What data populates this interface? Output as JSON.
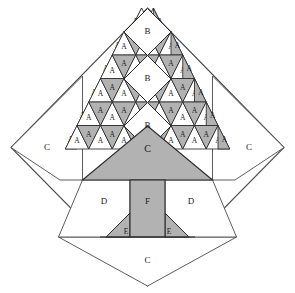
{
  "figure": {
    "name": "tree-quilt-block-diagram",
    "width": 295,
    "height": 293
  },
  "colors": {
    "background": "#ffffff",
    "fill_light": "#ffffff",
    "fill_shade": "#b2b2b2",
    "outline": "#2b2b2b",
    "outline_light": "#555555",
    "label_text": "#1a1a1a"
  },
  "geometry": {
    "center_x": 147.5,
    "center_y": 147.5,
    "diamond_top": {
      "x": 147.5,
      "y": 8
    },
    "diamond_right": {
      "x": 284,
      "y": 147.5
    },
    "diamond_bottom": {
      "x": 147.5,
      "y": 286
    },
    "diamond_left": {
      "x": 11,
      "y": 147.5
    },
    "cell": 23.5,
    "row_height": 23.5,
    "grid_rows": 7,
    "foliage_apex_y": 8,
    "foliage_base_y": 180,
    "trunk_top_y": 180,
    "trunk_bottom_y": 237,
    "baseline_y": 237
  },
  "legend": {
    "patch_codes": [
      "A",
      "B",
      "C",
      "D",
      "E",
      "F"
    ],
    "descriptions": {
      "A": "half-square triangle pair (foliage)",
      "B": "plain square on point (foliage highlight)",
      "C": "large corner / body triangle",
      "D": "background triangle beside trunk",
      "E": "small trunk-base triangle",
      "F": "trunk rectangle"
    }
  },
  "labels": {
    "A": "A",
    "B": "B",
    "C": "C",
    "D": "D",
    "E": "E",
    "F": "F"
  },
  "patches": {
    "B_squares": [
      {
        "label": "B",
        "x": 147.5,
        "y": 32
      },
      {
        "label": "B",
        "x": 147.5,
        "y": 79
      },
      {
        "label": "B",
        "x": 147.5,
        "y": 126
      }
    ],
    "C_pieces": [
      {
        "label": "C",
        "x": 47,
        "y": 148,
        "role": "left-corner"
      },
      {
        "label": "C",
        "x": 248,
        "y": 148,
        "role": "right-corner"
      },
      {
        "label": "C",
        "x": 147.5,
        "y": 263,
        "role": "bottom-corner"
      },
      {
        "label": "C",
        "x": 147.5,
        "y": 150,
        "role": "tree-body"
      }
    ],
    "D_pieces": [
      {
        "label": "D",
        "x": 104,
        "y": 202
      },
      {
        "label": "D",
        "x": 191,
        "y": 202
      }
    ],
    "E_pieces": [
      {
        "label": "E",
        "x": 127,
        "y": 232
      },
      {
        "label": "E",
        "x": 168,
        "y": 232
      }
    ],
    "F_pieces": [
      {
        "label": "F",
        "x": 147.5,
        "y": 202
      }
    ],
    "A_count": 66
  },
  "foliage_rows": [
    {
      "row": 1,
      "y_top": 8,
      "y_bottom": 31.5,
      "cells": [
        {
          "label": "A",
          "shade": "shade",
          "orient": "down-left"
        },
        {
          "label": "A",
          "shade": "light",
          "orient": "up"
        },
        {
          "label": "A",
          "shade": "light",
          "orient": "up"
        },
        {
          "label": "A",
          "shade": "shade",
          "orient": "down-right"
        }
      ]
    },
    {
      "row": 2,
      "y_top": 31.5,
      "y_bottom": 55,
      "cells": [
        {
          "label": "A",
          "shade": "shade",
          "orient": "down-left"
        },
        {
          "label": "A",
          "shade": "light",
          "orient": "up"
        },
        {
          "label": "A",
          "shade": "shade",
          "orient": "down"
        },
        {
          "label": "A",
          "shade": "light",
          "orient": "up"
        },
        {
          "label": "A",
          "shade": "shade",
          "orient": "down"
        },
        {
          "label": "A",
          "shade": "light",
          "orient": "up"
        },
        {
          "label": "A",
          "shade": "shade",
          "orient": "down-right"
        }
      ]
    },
    {
      "row": 3,
      "y_top": 55,
      "y_bottom": 78.5,
      "cells": [
        {
          "label": "A",
          "shade": "shade",
          "orient": "down-left"
        },
        {
          "label": "A",
          "shade": "light",
          "orient": "up"
        },
        {
          "label": "A",
          "shade": "shade",
          "orient": "down"
        },
        {
          "label": "A",
          "shade": "light",
          "orient": "up"
        },
        {
          "label": "A",
          "shade": "shade",
          "orient": "down"
        },
        {
          "label": "A",
          "shade": "light",
          "orient": "up"
        },
        {
          "label": "A",
          "shade": "shade",
          "orient": "down"
        },
        {
          "label": "A",
          "shade": "light",
          "orient": "up"
        },
        {
          "label": "A",
          "shade": "shade",
          "orient": "down-right"
        }
      ]
    },
    {
      "row": 4,
      "y_top": 78.5,
      "y_bottom": 102,
      "cells": [
        {
          "label": "A",
          "shade": "shade",
          "orient": "down-left"
        },
        {
          "label": "A",
          "shade": "light",
          "orient": "up"
        },
        {
          "label": "A",
          "shade": "shade",
          "orient": "down"
        },
        {
          "label": "A",
          "shade": "light",
          "orient": "up"
        },
        {
          "label": "A",
          "shade": "shade",
          "orient": "down"
        },
        {
          "label": "A",
          "shade": "light",
          "orient": "up"
        },
        {
          "label": "A",
          "shade": "shade",
          "orient": "down"
        },
        {
          "label": "A",
          "shade": "light",
          "orient": "up"
        },
        {
          "label": "A",
          "shade": "shade",
          "orient": "down"
        },
        {
          "label": "A",
          "shade": "light",
          "orient": "up"
        },
        {
          "label": "A",
          "shade": "shade",
          "orient": "down-right"
        }
      ]
    },
    {
      "row": 5,
      "y_top": 102,
      "y_bottom": 125.5,
      "cells": [
        {
          "label": "A",
          "shade": "shade",
          "orient": "down-left"
        },
        {
          "label": "A",
          "shade": "light",
          "orient": "up"
        },
        {
          "label": "A",
          "shade": "shade",
          "orient": "down"
        },
        {
          "label": "A",
          "shade": "light",
          "orient": "up"
        },
        {
          "label": "A",
          "shade": "shade",
          "orient": "down"
        },
        {
          "label": "A",
          "shade": "light",
          "orient": "up"
        },
        {
          "label": "A",
          "shade": "shade",
          "orient": "down"
        },
        {
          "label": "A",
          "shade": "light",
          "orient": "up"
        },
        {
          "label": "A",
          "shade": "shade",
          "orient": "down"
        },
        {
          "label": "A",
          "shade": "light",
          "orient": "up"
        },
        {
          "label": "A",
          "shade": "shade",
          "orient": "down"
        },
        {
          "label": "A",
          "shade": "light",
          "orient": "up"
        },
        {
          "label": "A",
          "shade": "shade",
          "orient": "down-right"
        }
      ]
    },
    {
      "row": 6,
      "y_top": 125.5,
      "y_bottom": 149,
      "cells": [
        {
          "label": "A",
          "shade": "shade",
          "orient": "down-left"
        },
        {
          "label": "A",
          "shade": "light",
          "orient": "up"
        },
        {
          "label": "A",
          "shade": "shade",
          "orient": "down"
        },
        {
          "label": "A",
          "shade": "light",
          "orient": "up"
        },
        {
          "label": "A",
          "shade": "shade",
          "orient": "down"
        },
        {
          "label": "A",
          "shade": "light",
          "orient": "up"
        },
        {
          "label": "A",
          "shade": "shade",
          "orient": "down"
        },
        {
          "label": "A",
          "shade": "light",
          "orient": "up"
        },
        {
          "label": "A",
          "shade": "shade",
          "orient": "down"
        },
        {
          "label": "A",
          "shade": "light",
          "orient": "up"
        },
        {
          "label": "A",
          "shade": "shade",
          "orient": "down"
        },
        {
          "label": "A",
          "shade": "light",
          "orient": "up"
        },
        {
          "label": "A",
          "shade": "shade",
          "orient": "down"
        },
        {
          "label": "A",
          "shade": "light",
          "orient": "up"
        },
        {
          "label": "A",
          "shade": "shade",
          "orient": "down-right"
        }
      ]
    },
    {
      "row": 7,
      "y_top": 149,
      "y_bottom": 172.5,
      "cells": [
        {
          "label": "A",
          "shade": "shade",
          "orient": "down-left"
        },
        {
          "label": "A",
          "shade": "light",
          "orient": "up"
        },
        {
          "label": "A",
          "shade": "shade",
          "orient": "down"
        },
        {
          "label": "A",
          "shade": "light",
          "orient": "up"
        },
        {
          "label": "A",
          "shade": "shade",
          "orient": "down-right"
        }
      ]
    }
  ]
}
